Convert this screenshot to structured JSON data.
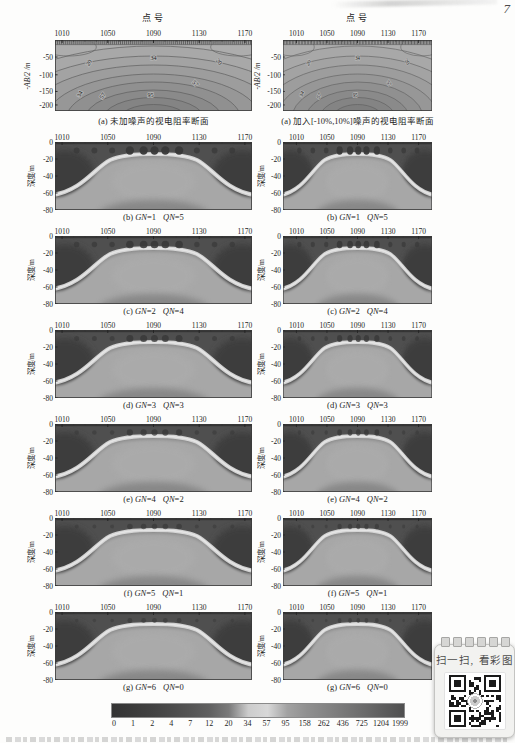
{
  "page": {
    "number": "7"
  },
  "figure": {
    "axis": {
      "x_title": "点号",
      "x_ticks": [
        "1010",
        "1050",
        "1090",
        "1130",
        "1170"
      ],
      "contour_y_label": "-AB/2 /m",
      "contour_y_ticks": [
        "-50",
        "-100",
        "-150",
        "-200"
      ],
      "section_y_label": "深度/m",
      "section_y_ticks": [
        "0",
        "-20",
        "-40",
        "-60",
        "-80"
      ]
    },
    "contour_captions": {
      "left": "(a) 未加噪声的视电阻率断面",
      "right": "(a) 加入[-10%,10%]噪声的视电阻率断面"
    },
    "contour_labels": [
      {
        "text": "20",
        "x": 36,
        "y": 24,
        "rot": -55
      },
      {
        "text": "34",
        "x": 100,
        "y": 20,
        "rot": 0
      },
      {
        "text": "20",
        "x": 165,
        "y": 23,
        "rot": 50
      },
      {
        "text": "34",
        "x": 27,
        "y": 55,
        "rot": -60
      },
      {
        "text": "57",
        "x": 50,
        "y": 57,
        "rot": -55
      },
      {
        "text": "57",
        "x": 141,
        "y": 45,
        "rot": 45
      },
      {
        "text": "95",
        "x": 97,
        "y": 57,
        "rot": 0
      }
    ],
    "row_captions": [
      {
        "label": "(b)",
        "params": [
          {
            "sym": "GN",
            "val": "=1"
          },
          {
            "sym": "QN",
            "val": "=5"
          }
        ]
      },
      {
        "label": "(c)",
        "params": [
          {
            "sym": "GN",
            "val": "=2"
          },
          {
            "sym": "QN",
            "val": "=4"
          }
        ]
      },
      {
        "label": "(d)",
        "params": [
          {
            "sym": "GN",
            "val": "=3"
          },
          {
            "sym": "QN",
            "val": "=3"
          }
        ]
      },
      {
        "label": "(e)",
        "params": [
          {
            "sym": "GN",
            "val": "=4"
          },
          {
            "sym": "QN",
            "val": "=2"
          }
        ]
      },
      {
        "label": "(f)",
        "params": [
          {
            "sym": "GN",
            "val": "=5"
          },
          {
            "sym": "QN",
            "val": "=1"
          }
        ]
      },
      {
        "label": "(g)",
        "params": [
          {
            "sym": "GN",
            "val": "=6"
          },
          {
            "sym": "QN",
            "val": "=0"
          }
        ]
      }
    ],
    "colorbar": {
      "tick_labels": [
        "0",
        "1",
        "2",
        "4",
        "7",
        "12",
        "20",
        "34",
        "57",
        "95",
        "158",
        "262",
        "436",
        "725",
        "1204",
        "1999"
      ],
      "colors": [
        "#343434",
        "#3a3a3a",
        "#414141",
        "#4a4a4a",
        "#545454",
        "#606060",
        "#7a7a7a",
        "#cccccc",
        "#d8d8d8",
        "#a2a2a2",
        "#909090",
        "#848484",
        "#777777",
        "#6a6a6a",
        "#5c5c5c",
        "#4f4f4f"
      ]
    },
    "qr": {
      "label": "扫一扫, 看彩图"
    }
  },
  "chart_data": [
    {
      "type": "heatmap",
      "subtype": "contour-pseudosection",
      "titles": [
        "(a) 未加噪声的视电阻率断面",
        "(a) 加入[-10%,10%]噪声的视电阻率断面"
      ],
      "xlabel": "点号",
      "x_ticks": [
        1010,
        1050,
        1090,
        1130,
        1170
      ],
      "ylabel": "-AB/2 /m",
      "y_ticks": [
        -50,
        -100,
        -150,
        -200
      ],
      "contour_levels_labeled": [
        20,
        34,
        57,
        95
      ],
      "pattern": "nested dome-shaped contours, apparent resistivity increasing toward bottom center"
    },
    {
      "type": "heatmap",
      "subtype": "inversion-depth-sections",
      "columns": [
        "left: 未加噪声 data",
        "right: 加入[-10%,10%]噪声 data"
      ],
      "rows": [
        {
          "panel": "(b)",
          "GN": 1,
          "QN": 5
        },
        {
          "panel": "(c)",
          "GN": 2,
          "QN": 4
        },
        {
          "panel": "(d)",
          "GN": 3,
          "QN": 3
        },
        {
          "panel": "(e)",
          "GN": 4,
          "QN": 2
        },
        {
          "panel": "(f)",
          "GN": 5,
          "QN": 1
        },
        {
          "panel": "(g)",
          "GN": 6,
          "QN": 0
        }
      ],
      "xlabel": "",
      "x_ticks": [
        1010,
        1050,
        1090,
        1130,
        1170
      ],
      "ylabel": "深度/m",
      "y_ticks": [
        0,
        -20,
        -40,
        -60,
        -80
      ],
      "pattern": "high-resistivity dome rising to about -18 m in the center (points ~1055-1125), flanks dipping to ~-60 m at edges, dark low-resistivity zones in upper corners and blob artifacts near surface",
      "colorbar_values": [
        0,
        1,
        2,
        4,
        7,
        12,
        20,
        34,
        57,
        95,
        158,
        262,
        436,
        725,
        1204,
        1999
      ]
    }
  ]
}
